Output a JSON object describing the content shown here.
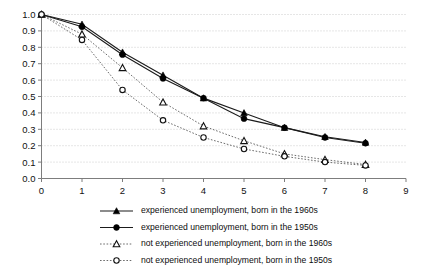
{
  "chart_data": {
    "type": "line",
    "title": "",
    "subtitle": "",
    "xlabel": "",
    "ylabel": "",
    "xlim": [
      0,
      9
    ],
    "ylim": [
      0,
      1.0
    ],
    "grid": true,
    "legend_position": "bottom",
    "x": [
      0,
      1,
      2,
      3,
      4,
      5,
      6,
      7,
      8
    ],
    "xticks": [
      "0",
      "1",
      "2",
      "3",
      "4",
      "5",
      "6",
      "7",
      "8",
      "9"
    ],
    "yticks": [
      "0.0",
      "0.1",
      "0.2",
      "0.3",
      "0.4",
      "0.5",
      "0.6",
      "0.7",
      "0.8",
      "0.9",
      "1.0"
    ],
    "series": [
      {
        "name": "experienced unemployment, born in the 1960s",
        "marker": "triangle-filled",
        "line": "solid",
        "color": "#1b1b1b",
        "values": [
          1.0,
          0.94,
          0.77,
          0.63,
          0.49,
          0.4,
          0.31,
          0.255,
          0.22
        ]
      },
      {
        "name": "experienced unemployment, born in the 1950s",
        "marker": "circle-filled",
        "line": "solid",
        "color": "#1b1b1b",
        "values": [
          1.0,
          0.925,
          0.755,
          0.61,
          0.49,
          0.365,
          0.31,
          0.25,
          0.215
        ]
      },
      {
        "name": "not experienced unemployment, born in the 1960s",
        "marker": "triangle-open",
        "line": "dotted",
        "color": "#5a5a5a",
        "values": [
          1.0,
          0.88,
          0.675,
          0.465,
          0.32,
          0.23,
          0.15,
          0.115,
          0.085
        ]
      },
      {
        "name": "not experienced unemployment, born in the 1950s",
        "marker": "circle-open",
        "line": "dotted",
        "color": "#5a5a5a",
        "values": [
          1.0,
          0.845,
          0.54,
          0.355,
          0.25,
          0.18,
          0.135,
          0.1,
          0.08
        ]
      }
    ]
  },
  "legend": {
    "items": [
      {
        "label": "experienced unemployment, born in the 1960s",
        "marker": "triangle-filled",
        "line": "solid"
      },
      {
        "label": "experienced unemployment, born in the 1950s",
        "marker": "circle-filled",
        "line": "solid"
      },
      {
        "label": "not experienced unemployment, born in the 1960s",
        "marker": "triangle-open",
        "line": "dotted"
      },
      {
        "label": "not experienced unemployment, born in the 1950s",
        "marker": "circle-open",
        "line": "dotted"
      }
    ]
  },
  "colors": {
    "solid_line": "#1b1b1b",
    "dotted_line": "#5a5a5a",
    "grid": "#b9b9b9",
    "axis": "#7d7d7d",
    "background": "#ffffff"
  }
}
